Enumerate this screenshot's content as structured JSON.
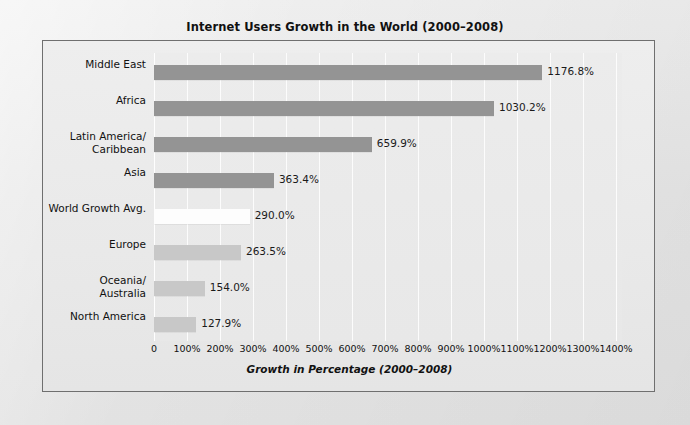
{
  "chart_data": {
    "type": "bar",
    "orientation": "horizontal",
    "title": "Internet Users Growth in the World (2000–2008)",
    "xlabel": "Growth in Percentage (2000–2008)",
    "ylabel": "",
    "xlim": [
      0,
      1400
    ],
    "grid": true,
    "legend": "none",
    "xticks": [
      "0",
      "100%",
      "200%",
      "300%",
      "400%",
      "500%",
      "600%",
      "700%",
      "800%",
      "900%",
      "1000%",
      "1100%",
      "1200%",
      "1300%",
      "1400%"
    ],
    "xtick_values": [
      0,
      100,
      200,
      300,
      400,
      500,
      600,
      700,
      800,
      900,
      1000,
      1100,
      1200,
      1300,
      1400
    ],
    "categories": [
      "Middle East",
      "Africa",
      "Latin America/\nCaribbean",
      "Asia",
      "World Growth Avg.",
      "Europe",
      "Oceania/\nAustralia",
      "North America"
    ],
    "values": [
      1176.8,
      1030.2,
      659.9,
      363.4,
      290.0,
      263.5,
      154.0,
      127.9
    ],
    "value_labels": [
      "1176.8%",
      "1030.2%",
      "659.9%",
      "363.4%",
      "290.0%",
      "263.5%",
      "154.0%",
      "127.9%"
    ],
    "bar_colors": [
      "#949494",
      "#949494",
      "#949494",
      "#949494",
      "#fdfdfd",
      "#c8c8c8",
      "#c8c8c8",
      "#c8c8c8"
    ]
  },
  "colors": {
    "page_background": "#e8e8e8",
    "figure_border": "#6f6f6f",
    "plot_background": "#ebebeb",
    "gridline": "#ffffff",
    "bar_dark": "#949494",
    "bar_light": "#c8c8c8",
    "bar_white": "#fdfdfd",
    "text": "#111111"
  }
}
